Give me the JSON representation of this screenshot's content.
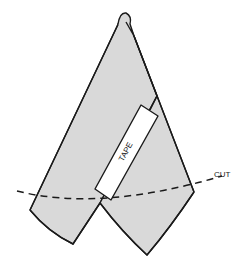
{
  "diagram": {
    "labels": {
      "tape": "TAPE",
      "cut": "CUT"
    },
    "colors": {
      "fabric": "#d9d9d9",
      "outline": "#1a1a1a",
      "tape": "#ffffff",
      "background": "#ffffff"
    }
  }
}
